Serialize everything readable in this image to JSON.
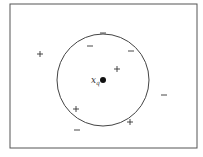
{
  "diagram": {
    "frame": {
      "x": 10,
      "y": 4,
      "width": 187,
      "height": 144,
      "stroke": "#555555"
    },
    "circle": {
      "cx": 103,
      "cy": 80,
      "r": 46,
      "stroke": "#444444"
    },
    "query": {
      "label": "x",
      "subscript": "q",
      "cx": 103,
      "cy": 80,
      "r": 3,
      "label_x": 91,
      "label_y": 83
    },
    "points": [
      {
        "type": "+",
        "x": 40,
        "y": 54
      },
      {
        "type": "-",
        "x": 103,
        "y": 33
      },
      {
        "type": "-",
        "x": 90,
        "y": 46
      },
      {
        "type": "-",
        "x": 131,
        "y": 51
      },
      {
        "type": "+",
        "x": 117,
        "y": 69
      },
      {
        "type": "-",
        "x": 164,
        "y": 95
      },
      {
        "type": "+",
        "x": 76,
        "y": 109
      },
      {
        "type": "-",
        "x": 77,
        "y": 130
      },
      {
        "type": "+",
        "x": 130,
        "y": 122
      }
    ],
    "colors": {
      "ink": "#333333",
      "dot": "#111111"
    }
  }
}
